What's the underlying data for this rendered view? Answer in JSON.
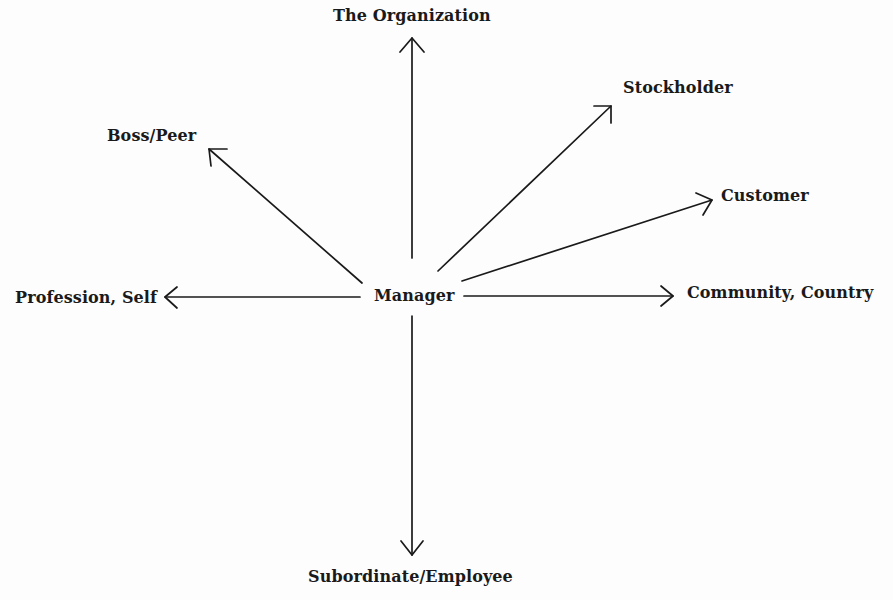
{
  "diagram": {
    "center": {
      "label": "Manager"
    },
    "nodes": [
      {
        "id": "organization",
        "label": "The Organization"
      },
      {
        "id": "stockholder",
        "label": "Stockholder"
      },
      {
        "id": "boss-peer",
        "label": "Boss/Peer"
      },
      {
        "id": "customer",
        "label": "Customer"
      },
      {
        "id": "profession-self",
        "label": "Profession, Self"
      },
      {
        "id": "community-country",
        "label": "Community, Country"
      },
      {
        "id": "subordinate-employee",
        "label": "Subordinate/Employee"
      }
    ],
    "edges": [
      {
        "from": "Manager",
        "to": "The Organization",
        "direction": "up"
      },
      {
        "from": "Manager",
        "to": "Stockholder",
        "direction": "up-right"
      },
      {
        "from": "Manager",
        "to": "Boss/Peer",
        "direction": "up-left"
      },
      {
        "from": "Manager",
        "to": "Customer",
        "direction": "right-up"
      },
      {
        "from": "Manager",
        "to": "Profession, Self",
        "direction": "left"
      },
      {
        "from": "Manager",
        "to": "Community, Country",
        "direction": "right"
      },
      {
        "from": "Manager",
        "to": "Subordinate/Employee",
        "direction": "down"
      }
    ],
    "colors": {
      "ink": "#1a1a1a",
      "background": "#fdfdfd"
    }
  }
}
